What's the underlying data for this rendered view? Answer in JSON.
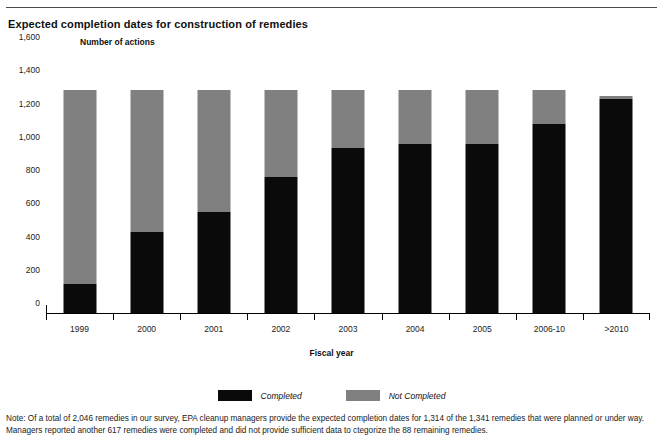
{
  "chart_data": {
    "type": "bar",
    "subtype": "stacked-bar",
    "title": "Expected completion dates for construction of remedies",
    "xlabel": "Fiscal year",
    "ylabel": "Number of actions",
    "ylim": [
      0,
      1600
    ],
    "yticks": [
      0,
      200,
      400,
      600,
      800,
      1000,
      1200,
      1400,
      1600
    ],
    "ytick_labels": [
      "0",
      "200",
      "400",
      "600",
      "800",
      "1,000",
      "1,200",
      "1,400",
      "1,600"
    ],
    "grid": false,
    "legend_position": "bottom",
    "categories": [
      "1999",
      "2000",
      "2001",
      "2002",
      "2003",
      "2004",
      "2005",
      "2006-10",
      ">2010"
    ],
    "series": [
      {
        "name": "Completed",
        "color": "#0a0a0a",
        "values": [
          175,
          490,
          610,
          820,
          990,
          1015,
          1015,
          1135,
          1290
        ]
      },
      {
        "name": "Not Completed",
        "color": "#808080",
        "values": [
          1166,
          851,
          731,
          521,
          351,
          326,
          326,
          206,
          15
        ]
      }
    ],
    "stack_totals": [
      1341,
      1341,
      1341,
      1341,
      1341,
      1341,
      1341,
      1341,
      1305
    ],
    "note_lines": [
      "Note: Of a total of 2,046 remedies in our survey, EPA cleanup managers provide the expected completion dates for 1,314 of the 1,341 remedies that were planned or under way.",
      "Managers reported another 617 remedies were completed and did not provide sufficient data to ctegorize the 88 remaining remedies."
    ]
  },
  "legend": {
    "items": [
      {
        "label": "Completed",
        "color": "#0a0a0a"
      },
      {
        "label": "Not Completed",
        "color": "#808080"
      }
    ]
  }
}
